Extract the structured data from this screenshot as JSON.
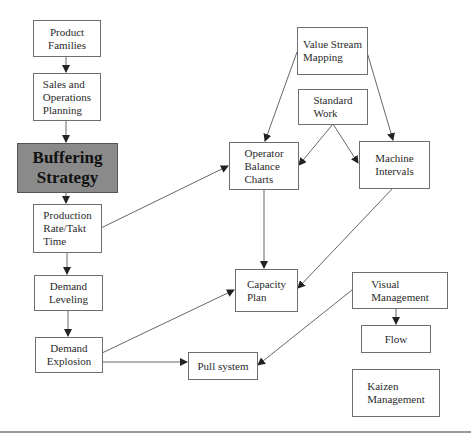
{
  "diagram": {
    "nodes": {
      "product_families": {
        "label": "Product\nFamilies"
      },
      "sales_ops": {
        "label": "Sales and\nOperations\nPlanning"
      },
      "buffering": {
        "label": "Buffering\nStrategy"
      },
      "production_rate": {
        "label": "Production\nRate/Takt\nTime"
      },
      "demand_leveling": {
        "label": "Demand\nLeveling"
      },
      "demand_explosion": {
        "label": "Demand\nExplosion"
      },
      "value_stream": {
        "label": "Value Stream\nMapping"
      },
      "standard_work": {
        "label": "Standard\nWork"
      },
      "operator_balance": {
        "label": "Operator\nBalance\nCharts"
      },
      "machine_intervals": {
        "label": "Machine\nIntervals"
      },
      "capacity_plan": {
        "label": "Capacity\nPlan"
      },
      "pull_system": {
        "label": "Pull system"
      },
      "visual_management": {
        "label": "Visual\nManagement"
      },
      "flow": {
        "label": "Flow"
      },
      "kaizen": {
        "label": "Kaizen\nManagement"
      }
    },
    "edges": [
      {
        "from": "Product Families",
        "to": "Sales and Operations Planning"
      },
      {
        "from": "Sales and Operations Planning",
        "to": "Buffering Strategy"
      },
      {
        "from": "Buffering Strategy",
        "to": "Production Rate/Takt Time"
      },
      {
        "from": "Production Rate/Takt Time",
        "to": "Demand Leveling"
      },
      {
        "from": "Demand Leveling",
        "to": "Demand Explosion"
      },
      {
        "from": "Production Rate/Takt Time",
        "to": "Operator Balance Charts"
      },
      {
        "from": "Demand Explosion",
        "to": "Capacity Plan"
      },
      {
        "from": "Demand Explosion",
        "to": "Pull system"
      },
      {
        "from": "Value Stream Mapping",
        "to": "Operator Balance Charts"
      },
      {
        "from": "Value Stream Mapping",
        "to": "Machine Intervals"
      },
      {
        "from": "Standard Work",
        "to": "Operator Balance Charts"
      },
      {
        "from": "Standard Work",
        "to": "Machine Intervals"
      },
      {
        "from": "Operator Balance Charts",
        "to": "Capacity Plan"
      },
      {
        "from": "Machine Intervals",
        "to": "Capacity Plan"
      },
      {
        "from": "Visual Management",
        "to": "Pull system"
      },
      {
        "from": "Visual Management",
        "to": "Flow"
      }
    ],
    "colors": {
      "highlight_fill": "#8a8a8a",
      "border": "#6e6e6e",
      "line": "#555555"
    }
  }
}
